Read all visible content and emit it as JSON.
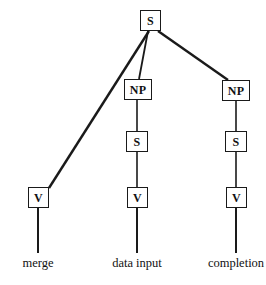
{
  "diagram": {
    "type": "syntax-tree",
    "title": "",
    "line_color": "#1a1a1a",
    "box_border_color": "#1a1a1a",
    "background_color": "#ffffff",
    "nodes": [
      {
        "id": "root-s",
        "label": "S",
        "x": 140,
        "y": 10,
        "w": 21,
        "h": 21,
        "font_size": 12
      },
      {
        "id": "mid-np",
        "label": "NP",
        "x": 124,
        "y": 79,
        "w": 28,
        "h": 21,
        "font_size": 12
      },
      {
        "id": "right-np",
        "label": "NP",
        "x": 222,
        "y": 80,
        "w": 28,
        "h": 21,
        "font_size": 12
      },
      {
        "id": "mid-s",
        "label": "S",
        "x": 126,
        "y": 131,
        "w": 22,
        "h": 21,
        "font_size": 12
      },
      {
        "id": "right-s",
        "label": "S",
        "x": 225,
        "y": 131,
        "w": 22,
        "h": 21,
        "font_size": 12
      },
      {
        "id": "left-v",
        "label": "V",
        "x": 28,
        "y": 187,
        "w": 21,
        "h": 21,
        "font_size": 12
      },
      {
        "id": "mid-v",
        "label": "V",
        "x": 127,
        "y": 187,
        "w": 21,
        "h": 21,
        "font_size": 12
      },
      {
        "id": "right-v",
        "label": "V",
        "x": 226,
        "y": 187,
        "w": 21,
        "h": 21,
        "font_size": 12
      }
    ],
    "edges": [
      {
        "id": "root-to-left-v",
        "from": "root-s",
        "to": "left-v",
        "x1": 149,
        "y1": 31,
        "x2": 49,
        "y2": 188,
        "width": 2.4
      },
      {
        "id": "root-to-mid-np",
        "from": "root-s",
        "to": "mid-np",
        "x1": 148,
        "y1": 31,
        "x2": 139,
        "y2": 79,
        "width": 1.8
      },
      {
        "id": "root-to-right-np",
        "from": "root-s",
        "to": "right-np",
        "x1": 158,
        "y1": 31,
        "x2": 228,
        "y2": 80,
        "width": 2.4
      },
      {
        "id": "mid-np-to-mid-s",
        "from": "mid-np",
        "to": "mid-s",
        "x1": 137,
        "y1": 100,
        "x2": 137,
        "y2": 131,
        "width": 1.6
      },
      {
        "id": "mid-s-to-mid-v",
        "from": "mid-s",
        "to": "mid-v",
        "x1": 137,
        "y1": 152,
        "x2": 137,
        "y2": 187,
        "width": 1.6
      },
      {
        "id": "mid-v-to-label",
        "from": "mid-v",
        "to": "data-input-label",
        "x1": 137,
        "y1": 208,
        "x2": 137,
        "y2": 253,
        "width": 2.0
      },
      {
        "id": "right-np-to-right-s",
        "from": "right-np",
        "to": "right-s",
        "x1": 236,
        "y1": 101,
        "x2": 236,
        "y2": 131,
        "width": 1.6
      },
      {
        "id": "right-s-to-right-v",
        "from": "right-s",
        "to": "right-v",
        "x1": 236,
        "y1": 152,
        "x2": 236,
        "y2": 187,
        "width": 1.6
      },
      {
        "id": "right-v-to-label",
        "from": "right-v",
        "to": "completion-label",
        "x1": 236,
        "y1": 208,
        "x2": 236,
        "y2": 253,
        "width": 2.0
      },
      {
        "id": "left-v-to-label",
        "from": "left-v",
        "to": "merge-label",
        "x1": 38,
        "y1": 208,
        "x2": 38,
        "y2": 253,
        "width": 2.0
      }
    ],
    "leaf_labels": [
      {
        "id": "merge-label",
        "text": "merge",
        "x": 38,
        "y": 257
      },
      {
        "id": "data-input-label",
        "text": "data input",
        "x": 137,
        "y": 257
      },
      {
        "id": "completion-label",
        "text": "completion",
        "x": 236,
        "y": 257
      }
    ]
  }
}
